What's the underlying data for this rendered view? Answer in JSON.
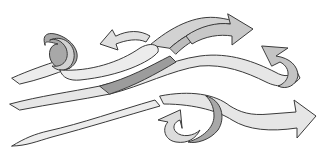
{
  "illustration": {
    "subject": "Swirling ribbon arrows (wind / flow)",
    "background": "#ffffff",
    "colors": {
      "outline": "#3a3a3a",
      "ribbon_light": "#ececec",
      "ribbon_mid": "#d2d2d2",
      "ribbon_dark": "#a8a8a8"
    },
    "elements": [
      {
        "id": "ribbon-top-loop",
        "description": "Ribbon from left with a loop, ending in left-pointing arrow"
      },
      {
        "id": "ribbon-top-right-arrow",
        "description": "Ribbon curving up to a right-pointing arrow at top right"
      },
      {
        "id": "ribbon-middle",
        "description": "Long wavy ribbon curling into a left-pointing arrow on right"
      },
      {
        "id": "ribbon-bottom-left",
        "description": "Tapered ribbon from left bottom"
      },
      {
        "id": "ribbon-bottom-right-arrow",
        "description": "Ribbon with curl ending in right-pointing arrow at bottom right"
      },
      {
        "id": "ribbon-bottom-curl-arrow",
        "description": "Small upward curl arrow near bottom center"
      }
    ]
  }
}
